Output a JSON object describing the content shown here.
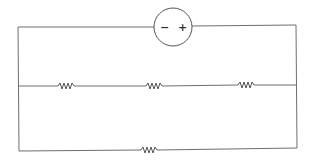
{
  "diagram": {
    "type": "circuit",
    "battery": {
      "negative_label": "−",
      "positive_label": "+",
      "cx": 173,
      "cy": 27,
      "r": 19
    },
    "wires": {
      "left_x": 18,
      "right_x": 296,
      "top_y": 27,
      "middle_y": 86,
      "bottom_y": 150
    },
    "resistors": [
      {
        "id": "R1",
        "branch": "middle",
        "x": 58,
        "y": 86
      },
      {
        "id": "R2",
        "branch": "middle",
        "x": 146,
        "y": 86
      },
      {
        "id": "R3",
        "branch": "middle",
        "x": 238,
        "y": 85
      },
      {
        "id": "R4",
        "branch": "bottom",
        "x": 141,
        "y": 150
      }
    ],
    "colors": {
      "wire": "#6e6e6e",
      "background": "#ffffff"
    }
  }
}
